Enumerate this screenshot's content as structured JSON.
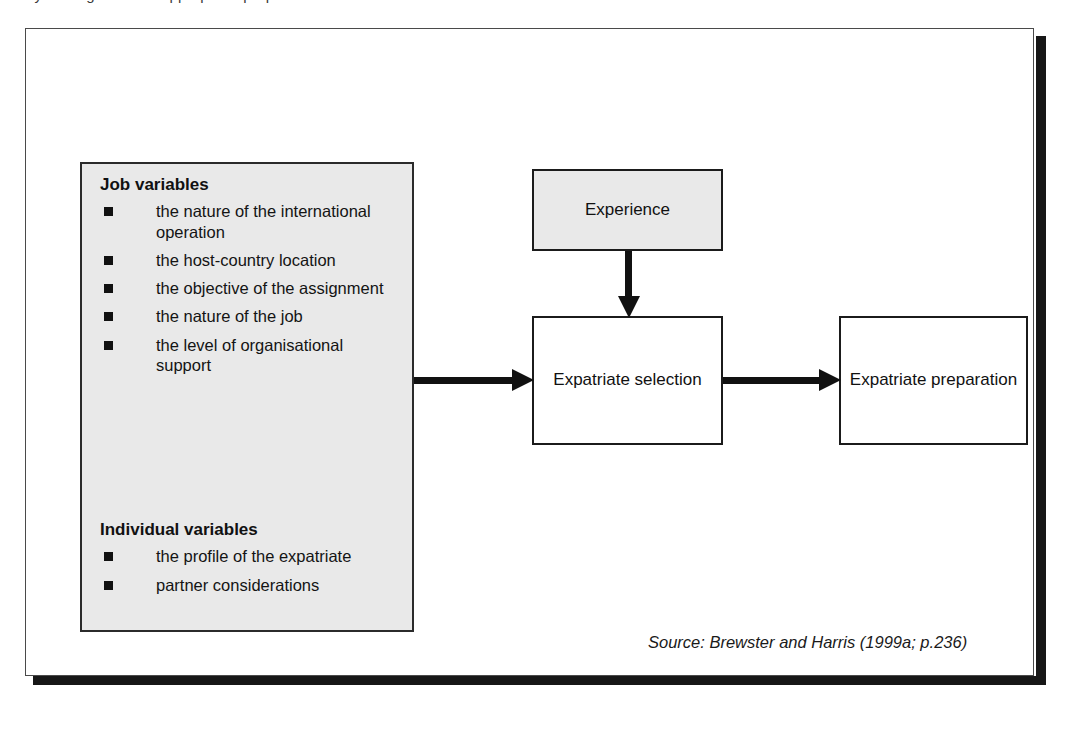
{
  "page": {
    "top_sliver_text": "by   the   organisation   appropriate   preparation"
  },
  "figure": {
    "variables_panel": {
      "job": {
        "heading": "Job variables",
        "items": [
          "the nature of the international operation",
          "the host-country location",
          "the objective of the assignment",
          "the nature of the job",
          "the level of organisational support"
        ]
      },
      "individual": {
        "heading": "Individual variables",
        "items": [
          "the profile of the expatriate",
          "partner considerations"
        ]
      }
    },
    "boxes": {
      "experience": "Experience",
      "expatriate_selection": "Expatriate selection",
      "expatriate_preparation": "Expatriate preparation"
    },
    "source": "Source: Brewster and Harris (1999a; p.236)",
    "colors": {
      "panel_fill": "#e9e9e9",
      "box_fill_white": "#ffffff",
      "line": "#111111",
      "frame_shadow": "#171717"
    }
  }
}
